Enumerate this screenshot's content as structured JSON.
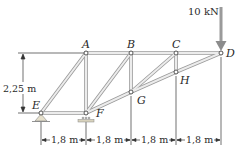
{
  "diagram": {
    "type": "truss",
    "nodes": {
      "A": {
        "label": "A",
        "x": 86,
        "y": 53
      },
      "B": {
        "label": "B",
        "x": 131,
        "y": 53
      },
      "C": {
        "label": "C",
        "x": 176,
        "y": 53
      },
      "D": {
        "label": "D",
        "x": 221,
        "y": 53
      },
      "E": {
        "label": "E",
        "x": 41,
        "y": 113
      },
      "F": {
        "label": "F",
        "x": 86,
        "y": 113
      },
      "G": {
        "label": "G",
        "x": 131,
        "y": 92
      },
      "H": {
        "label": "H",
        "x": 176,
        "y": 72
      }
    },
    "members": [
      [
        "E",
        "A"
      ],
      [
        "A",
        "B"
      ],
      [
        "B",
        "C"
      ],
      [
        "C",
        "D"
      ],
      [
        "E",
        "F"
      ],
      [
        "F",
        "G"
      ],
      [
        "G",
        "H"
      ],
      [
        "H",
        "D"
      ],
      [
        "A",
        "F"
      ],
      [
        "B",
        "G"
      ],
      [
        "C",
        "H"
      ],
      [
        "F",
        "B"
      ],
      [
        "G",
        "C"
      ]
    ],
    "supports": {
      "E": "pin",
      "F": "roller"
    },
    "load": {
      "node": "D",
      "label": "10 kN",
      "direction": "down"
    },
    "dimensions": {
      "height": "2,25 m",
      "spans": [
        "1,8 m",
        "1,8 m",
        "1,8 m",
        "1,8 m"
      ]
    },
    "colors": {
      "member": "#c8c8c8",
      "member_edge": "#8a8a8a",
      "line": "#333333",
      "load_arrow": "#9a9a9a",
      "support": "#b0a890"
    }
  }
}
